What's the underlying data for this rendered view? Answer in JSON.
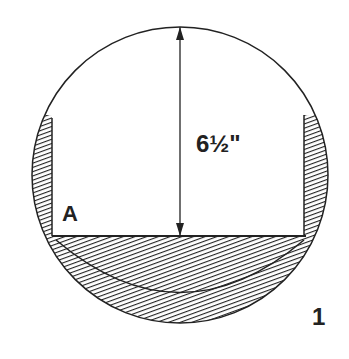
{
  "figure": {
    "number": "1",
    "dimension_label": "6½\"",
    "region_label": "A",
    "colors": {
      "ink": "#222222",
      "background": "#ffffff"
    }
  }
}
